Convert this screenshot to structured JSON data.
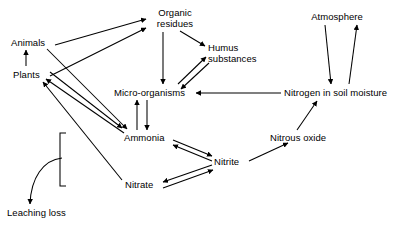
{
  "diagram": {
    "type": "flow-diagram",
    "background_color": "#ffffff",
    "line_color": "#000000",
    "nodes": [
      {
        "id": "organic-residues",
        "label": "Organic\nresidues",
        "x": 151,
        "y": 8,
        "width": 48,
        "align": "center"
      },
      {
        "id": "atmosphere",
        "label": "Atmosphere",
        "x": 307,
        "y": 12,
        "width": 60,
        "align": "center"
      },
      {
        "id": "animals",
        "label": "Animals",
        "x": 11,
        "y": 38,
        "width": 42,
        "align": "left"
      },
      {
        "id": "humus-substances",
        "label": "Humus\nsubstances",
        "x": 208,
        "y": 43,
        "width": 56,
        "align": "left"
      },
      {
        "id": "plants",
        "label": "Plants",
        "x": 13,
        "y": 70,
        "width": 32,
        "align": "left"
      },
      {
        "id": "micro-organisms",
        "label": "Micro-organisms",
        "x": 114,
        "y": 88,
        "width": 78,
        "align": "left"
      },
      {
        "id": "nitrogen-in-soil-moisture",
        "label": "Nitrogen in soil moisture",
        "x": 284,
        "y": 88,
        "width": 104,
        "align": "left"
      },
      {
        "id": "ammonia",
        "label": "Ammonia",
        "x": 124,
        "y": 133,
        "width": 46,
        "align": "left"
      },
      {
        "id": "nitrous-oxide",
        "label": "Nitrous oxide",
        "x": 270,
        "y": 133,
        "width": 66,
        "align": "left"
      },
      {
        "id": "nitrite",
        "label": "Nitrite",
        "x": 214,
        "y": 157,
        "width": 32,
        "align": "left"
      },
      {
        "id": "nitrate",
        "label": "Nitrate",
        "x": 125,
        "y": 180,
        "width": 34,
        "align": "left"
      },
      {
        "id": "leaching-loss",
        "label": "Leaching loss",
        "x": 7,
        "y": 208,
        "width": 66,
        "align": "left"
      }
    ],
    "edges": [
      {
        "id": "animals-to-organic-residues",
        "from": "animals",
        "to": "organic-residues"
      },
      {
        "id": "plants-to-organic-residues",
        "from": "plants",
        "to": "organic-residues"
      },
      {
        "id": "plants-to-animals",
        "from": "plants",
        "to": "animals"
      },
      {
        "id": "organic-residues-to-humus-substances",
        "from": "organic-residues",
        "to": "humus-substances"
      },
      {
        "id": "organic-residues-to-micro-organisms",
        "from": "organic-residues",
        "to": "micro-organisms"
      },
      {
        "id": "micro-organisms-to-humus-substances",
        "from": "micro-organisms",
        "to": "humus-substances"
      },
      {
        "id": "humus-substances-to-micro-organisms",
        "from": "humus-substances",
        "to": "micro-organisms"
      },
      {
        "id": "nitrogen-in-soil-moisture-to-micro-organisms",
        "from": "nitrogen-in-soil-moisture",
        "to": "micro-organisms"
      },
      {
        "id": "micro-organisms-to-ammonia",
        "from": "micro-organisms",
        "to": "ammonia"
      },
      {
        "id": "ammonia-to-micro-organisms",
        "from": "ammonia",
        "to": "micro-organisms"
      },
      {
        "id": "animals-to-ammonia",
        "from": "animals",
        "to": "ammonia"
      },
      {
        "id": "ammonia-to-plants",
        "from": "ammonia",
        "to": "plants"
      },
      {
        "id": "plants-to-ammonia",
        "from": "plants",
        "to": "ammonia"
      },
      {
        "id": "nitrate-to-plants",
        "from": "nitrate",
        "to": "plants"
      },
      {
        "id": "ammonia-to-nitrite",
        "from": "ammonia",
        "to": "nitrite"
      },
      {
        "id": "nitrite-to-ammonia",
        "from": "nitrite",
        "to": "ammonia"
      },
      {
        "id": "nitrite-to-nitrate",
        "from": "nitrite",
        "to": "nitrate"
      },
      {
        "id": "nitrate-to-nitrite",
        "from": "nitrate",
        "to": "nitrite"
      },
      {
        "id": "nitrite-to-nitrous-oxide",
        "from": "nitrite",
        "to": "nitrous-oxide"
      },
      {
        "id": "nitrous-oxide-to-nitrogen-in-soil-moisture",
        "from": "nitrous-oxide",
        "to": "nitrogen-in-soil-moisture"
      },
      {
        "id": "atmosphere-to-nitrogen-in-soil-moisture",
        "from": "atmosphere",
        "to": "nitrogen-in-soil-moisture"
      },
      {
        "id": "nitrogen-in-soil-moisture-to-atmosphere",
        "from": "nitrogen-in-soil-moisture",
        "to": "atmosphere"
      },
      {
        "id": "bracket-to-leaching-loss",
        "from": "nitrate-bracket",
        "to": "leaching-loss",
        "style": "curved"
      }
    ],
    "bracket": {
      "id": "nitrate-loss-bracket",
      "x": 60,
      "top": 133,
      "bottom": 186
    }
  }
}
